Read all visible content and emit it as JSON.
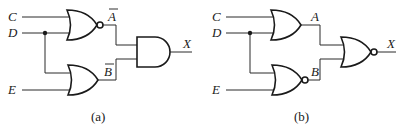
{
  "diagrams": [
    {
      "caption": "(a)",
      "inputs": [
        "C",
        "D",
        "E"
      ],
      "gate1": {
        "type": "NOR",
        "output_label": "A",
        "output_overbar": true
      },
      "gate2": {
        "type": "OR",
        "output_label": "B",
        "output_overbar": true
      },
      "final_gate": {
        "type": "AND",
        "output_label": "X"
      }
    },
    {
      "caption": "(b)",
      "inputs": [
        "C",
        "D",
        "E"
      ],
      "gate1": {
        "type": "OR",
        "output_label": "A",
        "output_overbar": false
      },
      "gate2": {
        "type": "NOR",
        "output_label": "B",
        "output_overbar": false
      },
      "final_gate": {
        "type": "NOR",
        "output_label": "X"
      }
    }
  ],
  "colors": {
    "line": "#1a1a1a",
    "background": "#ffffff"
  }
}
